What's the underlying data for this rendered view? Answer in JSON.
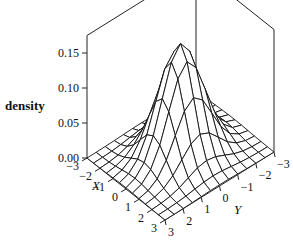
{
  "chart_data": {
    "type": "surface3d",
    "title": "",
    "xlabel": "X",
    "ylabel": "Y",
    "zlabel": "density",
    "x_ticks": [
      "-3",
      "-2",
      "-1",
      "0",
      "1",
      "2",
      "3"
    ],
    "y_ticks": [
      "-3",
      "-2",
      "-1",
      "0",
      "1",
      "2",
      "3"
    ],
    "z_ticks": [
      "0.00",
      "0.05",
      "0.10",
      "0.15"
    ],
    "xlim": [
      -3,
      3
    ],
    "ylim": [
      -3,
      3
    ],
    "zlim": [
      0,
      0.17
    ],
    "grid_resolution": 13,
    "peak": {
      "x": 0,
      "y": 0,
      "z": 0.159
    },
    "function": "z = exp(-(x^2+y^2)/2) / (2*pi)",
    "colors": {
      "line": "#111111",
      "background": "#ffffff"
    }
  }
}
